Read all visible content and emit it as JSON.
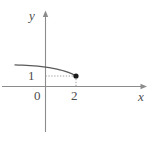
{
  "figure": {
    "name": "cartesian-graph-decreasing-curve",
    "background_color": "#ffffff",
    "width": 157,
    "height": 141
  },
  "axes": {
    "x_axis": {
      "label": "x",
      "color": "#808080",
      "arrow": true,
      "origin_px": 45.5,
      "baseline_px": 86.5,
      "start_px": 2,
      "end_px": 147
    },
    "y_axis": {
      "label": "y",
      "color": "#808080",
      "arrow": true,
      "top_px": 11,
      "bottom_px": 132
    }
  },
  "tick_labels": {
    "origin": "0",
    "y_one": "1",
    "x_two": "2"
  },
  "guides": {
    "color": "#9e9e9e",
    "style": "dotted",
    "horizontal_from_y_axis_to_point": true,
    "vertical_from_point_to_x_axis": true
  },
  "point": {
    "label": "",
    "x_value": 2,
    "y_value": 1,
    "px": {
      "x": 76,
      "y": 76
    },
    "color": "#1a1a1a",
    "radius_px": 2.6,
    "filled": true
  },
  "chart_data": {
    "type": "line",
    "title": "",
    "xlabel": "x",
    "ylabel": "y",
    "grid": false,
    "legend": null,
    "xlim": [
      -2.2,
      5.1
    ],
    "ylim": [
      -1.6,
      2.6
    ],
    "xticks": [
      0,
      2
    ],
    "xticklabels": [
      "0",
      "2"
    ],
    "yticks": [
      1
    ],
    "yticklabels": [
      "1"
    ],
    "annotations": [
      {
        "type": "point",
        "x": 2,
        "y": 1,
        "marker": "filled-circle",
        "note": "endpoint of curve"
      },
      {
        "type": "dotted-guide",
        "from": [
          0,
          1
        ],
        "to": [
          2,
          1
        ]
      },
      {
        "type": "dotted-guide",
        "from": [
          2,
          1
        ],
        "to": [
          2,
          0
        ]
      }
    ],
    "series": [
      {
        "name": "curve",
        "description": "decreasing concave-down curve, nearly flat at left, falling steeply to the endpoint (2, 1)",
        "x": [
          -2.0,
          -1.75,
          -1.5,
          -1.25,
          -1.0,
          -0.75,
          -0.5,
          -0.25,
          0.0,
          0.25,
          0.5,
          0.75,
          1.0,
          1.25,
          1.5,
          1.75,
          2.0
        ],
        "y": [
          2.05,
          2.04,
          2.03,
          2.01,
          1.99,
          1.96,
          1.93,
          1.89,
          1.84,
          1.79,
          1.73,
          1.66,
          1.57,
          1.47,
          1.35,
          1.2,
          1.0
        ]
      }
    ]
  }
}
